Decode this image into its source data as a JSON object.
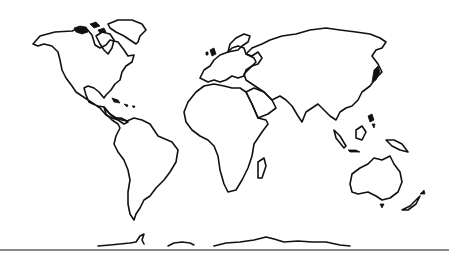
{
  "map": {
    "type": "world-outline",
    "projection": "equirectangular-like",
    "line_color": "#111111",
    "background": "#ffffff",
    "rule_color": "#8a8a8a",
    "regions": [
      {
        "name": "North America"
      },
      {
        "name": "Greenland"
      },
      {
        "name": "South America"
      },
      {
        "name": "Europe"
      },
      {
        "name": "Africa"
      },
      {
        "name": "Asia"
      },
      {
        "name": "Australia"
      },
      {
        "name": "Antarctica"
      }
    ]
  }
}
